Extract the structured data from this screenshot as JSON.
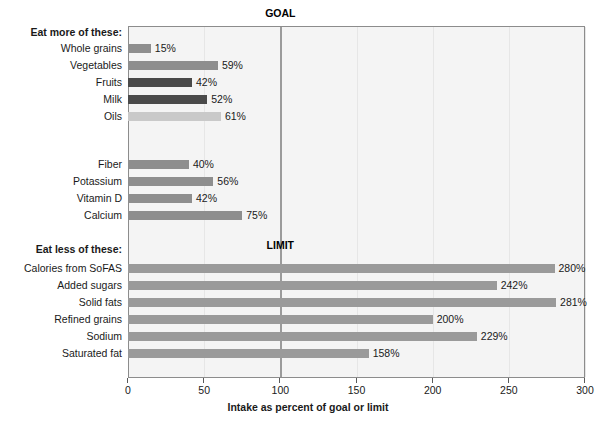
{
  "chart_data": {
    "type": "bar",
    "orientation": "horizontal",
    "title": "",
    "xlabel": "Intake as percent of goal or limit",
    "ylabel": "",
    "xlim": [
      0,
      300
    ],
    "xticks": [
      0,
      50,
      100,
      150,
      200,
      250,
      300
    ],
    "xtick_labels": [
      "0",
      "50",
      "100",
      "150",
      "200",
      "250",
      "300"
    ],
    "grid": true,
    "grid_axis": "x",
    "legend": "none",
    "reference_line": {
      "value": 100,
      "color": "#9b9b9b",
      "labels": [
        "GOAL",
        "LIMIT"
      ]
    },
    "annotations": [
      {
        "text": "GOAL",
        "at_x": 100,
        "position": "above-plot"
      },
      {
        "text": "LIMIT",
        "at_x": 100,
        "position": "mid-plot"
      },
      {
        "text": "Eat more of these:",
        "position": "y-axis-group-header"
      },
      {
        "text": "Eat less of these:",
        "position": "y-axis-group-header"
      }
    ],
    "groups": [
      {
        "header": "Eat more of these:",
        "items": [
          {
            "category": "Whole grains",
            "value": 15,
            "label": "15%",
            "color": "#8e8e8e"
          },
          {
            "category": "Vegetables",
            "value": 59,
            "label": "59%",
            "color": "#8e8e8e"
          },
          {
            "category": "Fruits",
            "value": 42,
            "label": "42%",
            "color": "#4a4a4a"
          },
          {
            "category": "Milk",
            "value": 52,
            "label": "52%",
            "color": "#4a4a4a"
          },
          {
            "category": "Oils",
            "value": 61,
            "label": "61%",
            "color": "#c9c9c9"
          }
        ]
      },
      {
        "header": "",
        "items": [
          {
            "category": "Fiber",
            "value": 40,
            "label": "40%",
            "color": "#8e8e8e"
          },
          {
            "category": "Potassium",
            "value": 56,
            "label": "56%",
            "color": "#8e8e8e"
          },
          {
            "category": "Vitamin D",
            "value": 42,
            "label": "42%",
            "color": "#8e8e8e"
          },
          {
            "category": "Calcium",
            "value": 75,
            "label": "75%",
            "color": "#8e8e8e"
          }
        ]
      },
      {
        "header": "Eat less of these:",
        "items": [
          {
            "category": "Calories from SoFAS",
            "value": 280,
            "label": "280%",
            "color": "#9a9a9a"
          },
          {
            "category": "Added sugars",
            "value": 242,
            "label": "242%",
            "color": "#9a9a9a"
          },
          {
            "category": "Solid fats",
            "value": 281,
            "label": "281%",
            "color": "#9a9a9a"
          },
          {
            "category": "Refined grains",
            "value": 200,
            "label": "200%",
            "color": "#9a9a9a"
          },
          {
            "category": "Sodium",
            "value": 229,
            "label": "229%",
            "color": "#9a9a9a"
          },
          {
            "category": "Saturated fat",
            "value": 158,
            "label": "158%",
            "color": "#9a9a9a"
          }
        ]
      }
    ],
    "categories": [
      "Whole grains",
      "Vegetables",
      "Fruits",
      "Milk",
      "Oils",
      "Fiber",
      "Potassium",
      "Vitamin D",
      "Calcium",
      "Calories from SoFAS",
      "Added sugars",
      "Solid fats",
      "Refined grains",
      "Sodium",
      "Saturated fat"
    ],
    "values": [
      15,
      59,
      42,
      52,
      61,
      40,
      56,
      42,
      75,
      280,
      242,
      281,
      200,
      229,
      158
    ],
    "value_labels": [
      "15%",
      "59%",
      "42%",
      "52%",
      "61%",
      "40%",
      "56%",
      "42%",
      "75%",
      "280%",
      "242%",
      "281%",
      "200%",
      "229%",
      "158%"
    ]
  },
  "plot": {
    "background": "#f4f4f4",
    "border_color": "#8c8c8c"
  }
}
